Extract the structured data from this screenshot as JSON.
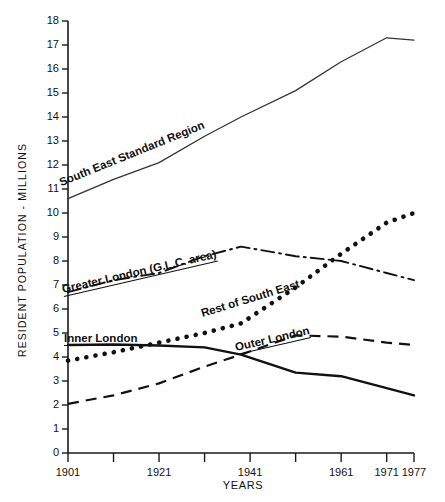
{
  "chart_data": {
    "type": "line",
    "title": "",
    "xlabel": "YEARS",
    "ylabel": "RESIDENT POPULATION - MILLIONS",
    "xlim": [
      1901,
      1977
    ],
    "ylim": [
      0,
      18
    ],
    "ytick_step": 1,
    "grid": false,
    "legend_position": "inline-annotations",
    "ytick_labels": [
      "18",
      "17",
      "16",
      "15",
      "14",
      "13",
      "12",
      "11",
      "10",
      "9",
      "8",
      "7",
      "6",
      "5",
      "4",
      "3",
      "2",
      "1",
      "0"
    ],
    "xtick_values": [
      1901,
      1911,
      1921,
      1931,
      1941,
      1951,
      1961,
      1971,
      1977
    ],
    "xtick_labels": [
      "1901",
      "",
      "1921",
      "",
      "1941",
      "",
      "1961",
      "1971",
      "1977"
    ],
    "x": [
      1901,
      1911,
      1921,
      1931,
      1939,
      1951,
      1961,
      1971,
      1977
    ],
    "series": [
      {
        "name": "South East Standard Region",
        "style": "thin-solid",
        "label_text": "South East Standard Region",
        "values": [
          10.6,
          11.4,
          12.1,
          13.2,
          14.0,
          15.1,
          16.3,
          17.3,
          17.2
        ]
      },
      {
        "name": "Greater London (G.L.C. area)",
        "style": "dash-dot",
        "label_text": "Greater London (G.L.C. area)",
        "values": [
          6.7,
          7.2,
          7.5,
          8.2,
          8.6,
          8.2,
          8.0,
          7.5,
          7.2
        ]
      },
      {
        "name": "Rest of South East",
        "style": "dotted",
        "label_text": "Rest of South East",
        "values": [
          3.85,
          4.2,
          4.6,
          5.0,
          5.4,
          6.9,
          8.3,
          9.6,
          10.0
        ]
      },
      {
        "name": "Inner London",
        "style": "thick-solid",
        "label_text": "Inner London",
        "values": [
          4.5,
          4.52,
          4.48,
          4.4,
          4.1,
          3.35,
          3.2,
          2.7,
          2.4
        ]
      },
      {
        "name": "Outer London",
        "style": "dashed",
        "label_text": "Outer London",
        "values": [
          2.05,
          2.4,
          2.9,
          3.6,
          4.1,
          4.9,
          4.85,
          4.6,
          4.5
        ]
      }
    ]
  }
}
